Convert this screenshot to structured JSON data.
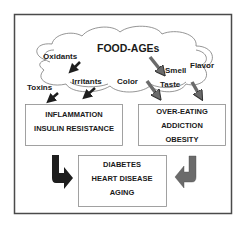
{
  "diagram": {
    "cloud": {
      "title": "FOOD-AGEs",
      "factors": {
        "oxidants": "Oxidants",
        "irritants": "Irritants",
        "toxins": "Toxins",
        "color": "Color",
        "smell": "Smell",
        "taste": "Taste",
        "flavor": "Flavor"
      }
    },
    "left_box": {
      "lines": [
        "INFLAMMATION",
        "INSULIN RESISTANCE"
      ]
    },
    "right_box": {
      "lines": [
        "OVER-EATING",
        "ADDICTION",
        "OBESITY"
      ]
    },
    "bottom_box": {
      "lines": [
        "DIABETES",
        "HEART DISEASE",
        "AGING"
      ]
    },
    "colors": {
      "dark_arrow": "#1e1e1e",
      "gray_arrow": "#6b6b6b",
      "frame": "#4a4a4a",
      "box_border": "#8a8a8a"
    }
  }
}
